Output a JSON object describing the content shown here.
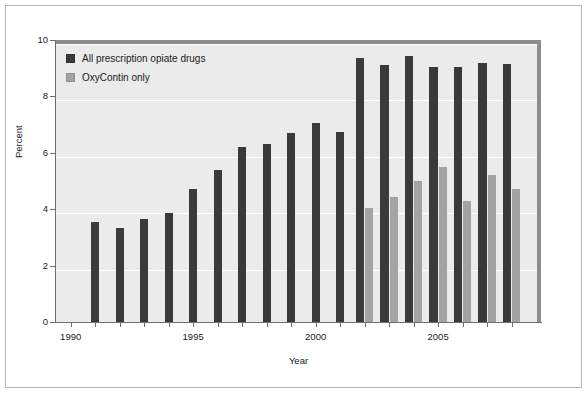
{
  "chart_data": {
    "type": "bar",
    "title": "",
    "xlabel": "Year",
    "ylabel": "Percent",
    "ylim": [
      0,
      10
    ],
    "ytick_values": [
      0,
      2,
      4,
      6,
      8,
      10
    ],
    "ytick_labels": [
      "0",
      "2",
      "4",
      "6",
      "8",
      "10"
    ],
    "xlim": [
      1989.4,
      2009.2
    ],
    "xtick_values": [
      1990,
      1995,
      2000,
      2005
    ],
    "xtick_labels": [
      "1990",
      "1995",
      "2000",
      "2005"
    ],
    "xtick_minor_values": [
      1991,
      1992,
      1993,
      1994,
      1996,
      1997,
      1998,
      1999,
      2001,
      2002,
      2003,
      2004,
      2006,
      2007,
      2008
    ],
    "grid": "horizontal",
    "legend_position": "upper left",
    "categories": [
      1991,
      1992,
      1993,
      1994,
      1995,
      1996,
      1997,
      1998,
      1999,
      2000,
      2001,
      2002,
      2003,
      2004,
      2005,
      2006,
      2007,
      2008
    ],
    "series": [
      {
        "name": "All prescription opiate drugs",
        "color": "#3a3a3a",
        "values": [
          3.55,
          3.35,
          3.65,
          3.85,
          4.7,
          5.4,
          6.2,
          6.3,
          6.7,
          7.05,
          6.75,
          9.35,
          9.1,
          9.45,
          9.05,
          9.05,
          9.2,
          9.15
        ]
      },
      {
        "name": "OxyContin only",
        "color": "#a3a3a3",
        "values": [
          null,
          null,
          null,
          null,
          null,
          null,
          null,
          null,
          null,
          null,
          null,
          4.05,
          4.45,
          5.0,
          5.5,
          4.3,
          5.2,
          4.7
        ]
      }
    ]
  },
  "legend": {
    "items": [
      {
        "label": "All prescription opiate drugs",
        "color": "#3a3a3a"
      },
      {
        "label": "OxyContin only",
        "color": "#a3a3a3"
      }
    ]
  },
  "axis": {
    "y_label": "Percent",
    "x_label": "Year"
  }
}
